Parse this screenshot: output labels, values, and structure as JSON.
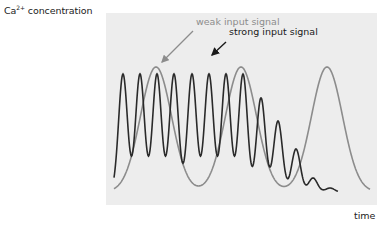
{
  "axes": {
    "y_label_base": "Ca",
    "y_label_sup": "2+",
    "y_label_rest": " concentration",
    "x_label": "time"
  },
  "annotations": {
    "weak": "weak input signal",
    "strong": "strong input signal"
  },
  "colors": {
    "background": "#ededed",
    "strong_signal": "#2a2a2a",
    "weak_signal": "#8c8c8c"
  },
  "series": {
    "strong_input_signal": {
      "description": "high-frequency Ca2+ oscillations, damping at end",
      "peak_x": [
        123,
        140,
        157,
        174,
        192,
        209,
        226,
        243,
        261,
        278,
        296,
        313,
        330
      ],
      "peak_y": [
        74,
        74,
        74,
        74,
        74,
        74,
        74,
        74,
        98,
        121,
        149,
        178,
        188
      ]
    },
    "weak_input_signal": {
      "description": "low-frequency Ca2+ oscillations",
      "peak_x": [
        156,
        241,
        327
      ],
      "peak_y": [
        67,
        67,
        67
      ]
    }
  }
}
